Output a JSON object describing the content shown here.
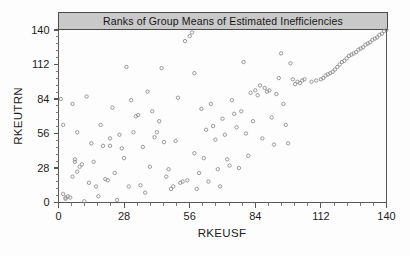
{
  "chart_data": {
    "type": "scatter",
    "title": "Ranks of Group Means of Estimated Inefficiencies",
    "xlabel": "RKEUSF",
    "ylabel": "RKEUTRN",
    "xlim": [
      0,
      140
    ],
    "ylim": [
      0,
      140
    ],
    "xticks": [
      0,
      28,
      56,
      84,
      112,
      140
    ],
    "yticks": [
      0,
      28,
      56,
      84,
      112,
      140
    ],
    "xtick_labels": [
      "0",
      "28",
      "56",
      "84",
      "112",
      "140"
    ],
    "ytick_labels": [
      "0",
      "28",
      "56",
      "84",
      "112",
      "140"
    ],
    "minor_ticks_per_major": 4,
    "grid": false,
    "legend": null,
    "marker": "open-circle",
    "marker_color": "#8a8a8a",
    "title_box_fill": "#c9c9c9",
    "axis_color": "#585858",
    "series": [
      {
        "name": "ranks",
        "points": [
          [
            1,
            84
          ],
          [
            2,
            7
          ],
          [
            2,
            63
          ],
          [
            3,
            4
          ],
          [
            3,
            3
          ],
          [
            4,
            5
          ],
          [
            5,
            4
          ],
          [
            6,
            80
          ],
          [
            6,
            21
          ],
          [
            7,
            35
          ],
          [
            7,
            33
          ],
          [
            8,
            57
          ],
          [
            8,
            25
          ],
          [
            9,
            29
          ],
          [
            10,
            31
          ],
          [
            11,
            1
          ],
          [
            12,
            86
          ],
          [
            13,
            16
          ],
          [
            14,
            48
          ],
          [
            15,
            33
          ],
          [
            16,
            13
          ],
          [
            17,
            5
          ],
          [
            18,
            63
          ],
          [
            19,
            46
          ],
          [
            20,
            19
          ],
          [
            21,
            18
          ],
          [
            22,
            52
          ],
          [
            22,
            46
          ],
          [
            23,
            77
          ],
          [
            24,
            24
          ],
          [
            25,
            2
          ],
          [
            26,
            55
          ],
          [
            27,
            44
          ],
          [
            28,
            36
          ],
          [
            29,
            110
          ],
          [
            30,
            13
          ],
          [
            31,
            83
          ],
          [
            32,
            57
          ],
          [
            33,
            70
          ],
          [
            34,
            71
          ],
          [
            35,
            14
          ],
          [
            36,
            45
          ],
          [
            37,
            8
          ],
          [
            38,
            90
          ],
          [
            39,
            29
          ],
          [
            40,
            74
          ],
          [
            41,
            53
          ],
          [
            42,
            57
          ],
          [
            43,
            66
          ],
          [
            44,
            109
          ],
          [
            45,
            49
          ],
          [
            46,
            21
          ],
          [
            47,
            27
          ],
          [
            48,
            11
          ],
          [
            49,
            13
          ],
          [
            50,
            50
          ],
          [
            51,
            85
          ],
          [
            52,
            16
          ],
          [
            53,
            17
          ],
          [
            54,
            131
          ],
          [
            55,
            18
          ],
          [
            56,
            135
          ],
          [
            57,
            138
          ],
          [
            58,
            105
          ],
          [
            58,
            40
          ],
          [
            59,
            11
          ],
          [
            60,
            24
          ],
          [
            61,
            76
          ],
          [
            62,
            36
          ],
          [
            63,
            59
          ],
          [
            64,
            17
          ],
          [
            65,
            80
          ],
          [
            66,
            62
          ],
          [
            67,
            51
          ],
          [
            68,
            27
          ],
          [
            69,
            13
          ],
          [
            70,
            68
          ],
          [
            71,
            55
          ],
          [
            72,
            35
          ],
          [
            73,
            30
          ],
          [
            74,
            83
          ],
          [
            75,
            72
          ],
          [
            76,
            61
          ],
          [
            77,
            28
          ],
          [
            78,
            74
          ],
          [
            79,
            114
          ],
          [
            80,
            56
          ],
          [
            81,
            38
          ],
          [
            82,
            89
          ],
          [
            83,
            66
          ],
          [
            84,
            91
          ],
          [
            85,
            87
          ],
          [
            86,
            95
          ],
          [
            87,
            52
          ],
          [
            88,
            93
          ],
          [
            89,
            90
          ],
          [
            90,
            91
          ],
          [
            91,
            69
          ],
          [
            92,
            47
          ],
          [
            93,
            88
          ],
          [
            94,
            101
          ],
          [
            95,
            121
          ],
          [
            96,
            80
          ],
          [
            97,
            63
          ],
          [
            98,
            48
          ],
          [
            99,
            113
          ],
          [
            100,
            100
          ],
          [
            101,
            96
          ],
          [
            102,
            98
          ],
          [
            103,
            97
          ],
          [
            104,
            99
          ],
          [
            105,
            100
          ],
          [
            108,
            98
          ],
          [
            110,
            99
          ],
          [
            112,
            100
          ],
          [
            113,
            101
          ],
          [
            114,
            103
          ],
          [
            115,
            104
          ],
          [
            116,
            105
          ],
          [
            117,
            106
          ],
          [
            118,
            108
          ],
          [
            119,
            110
          ],
          [
            120,
            112
          ],
          [
            121,
            114
          ],
          [
            122,
            115
          ],
          [
            123,
            117
          ],
          [
            124,
            119
          ],
          [
            125,
            120
          ],
          [
            126,
            121
          ],
          [
            127,
            122
          ],
          [
            128,
            124
          ],
          [
            129,
            125
          ],
          [
            130,
            126
          ],
          [
            131,
            128
          ],
          [
            132,
            129
          ],
          [
            133,
            130
          ],
          [
            134,
            132
          ],
          [
            135,
            133
          ],
          [
            136,
            134
          ],
          [
            137,
            136
          ],
          [
            138,
            137
          ],
          [
            139,
            139
          ],
          [
            140,
            140
          ]
        ]
      }
    ]
  }
}
